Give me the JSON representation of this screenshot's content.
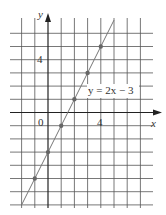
{
  "chart_data": {
    "type": "line",
    "title": "",
    "equation_label": "y = 2x − 3",
    "xlabel": "x",
    "ylabel": "y",
    "x_tick_labels": [
      {
        "value": 0,
        "label": "0"
      },
      {
        "value": 4,
        "label": "4"
      }
    ],
    "y_tick_labels": [
      {
        "value": 4,
        "label": "4"
      }
    ],
    "xlim": [
      -2,
      7
    ],
    "ylim": [
      -7,
      6
    ],
    "grid": true,
    "series": [
      {
        "name": "y = 2x − 3",
        "x": [
          -1,
          0,
          1,
          2,
          3,
          4
        ],
        "y": [
          -5,
          -3,
          -1,
          1,
          3,
          5
        ]
      }
    ],
    "line_extent": {
      "x_start": -2,
      "x_end": 5
    }
  },
  "labels": {
    "x_axis": "x",
    "y_axis": "y",
    "origin": "0",
    "x_tick_4": "4",
    "y_tick_4": "4",
    "equation": "y = 2x − 3"
  },
  "colors": {
    "grid": "#555555",
    "axis": "#222222",
    "line": "#777777",
    "point": "#666666"
  }
}
